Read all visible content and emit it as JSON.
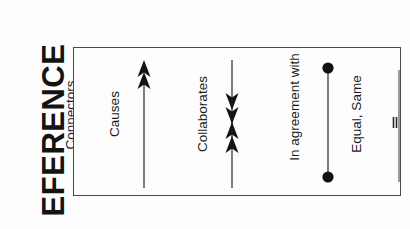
{
  "document": {
    "heading_partial": "EFERENCE"
  },
  "legend": {
    "title": "Connectors",
    "entries": [
      {
        "label": "Causes",
        "symbol": "single-headed-arrow-up",
        "description": "vertical line with a double-chevron arrowhead at the top"
      },
      {
        "label": "Collaborates",
        "symbol": "double-headed-arrow",
        "description": "vertical line with stacked down and up chevron arrowheads in the middle"
      },
      {
        "label": "In agreement with",
        "symbol": "line-with-dot-endpoints",
        "description": "vertical line terminated by a filled circle at each end"
      },
      {
        "label": "Equal, Same",
        "symbol": "line-with-equals-sign",
        "description": "vertical line crossed by an equals sign"
      }
    ]
  },
  "colors": {
    "ink": "#1b1b1b",
    "panel_border": "#4a4a4a",
    "background": "#fdfdfd",
    "symbol": "#2a2a2a"
  }
}
